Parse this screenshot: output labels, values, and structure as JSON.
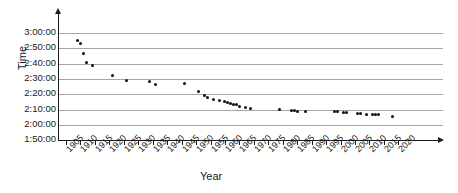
{
  "chart_data": {
    "type": "scatter",
    "title": "",
    "xlabel": "Year",
    "ylabel": "Time",
    "xlim": [
      1903,
      2023
    ],
    "ylim": [
      "1:50:00",
      "3:05:00"
    ],
    "grid": true,
    "legend": "none",
    "xtick_labels": [
      "1905",
      "1910",
      "1915",
      "1920",
      "1925",
      "1930",
      "1935",
      "1940",
      "1945",
      "1950",
      "1955",
      "1960",
      "1965",
      "1970",
      "1975",
      "1980",
      "1985",
      "1990",
      "1995",
      "2000",
      "2005",
      "2010",
      "2015",
      "2020"
    ],
    "ytick_labels": [
      "3:00:00",
      "2:50:00",
      "2:40:00",
      "2:30:00",
      "2:20:00",
      "2:10:00",
      "2:00:00",
      "1:50:00"
    ],
    "ytick_minutes": [
      180,
      170,
      160,
      150,
      140,
      130,
      120,
      110
    ],
    "series": [
      {
        "name": "Winning time",
        "marker": "circle",
        "color": "#0d0d0d",
        "points": [
          {
            "x": 1909,
            "y": 175.0
          },
          {
            "x": 1910,
            "y": 173.0
          },
          {
            "x": 1911,
            "y": 166.5
          },
          {
            "x": 1912,
            "y": 160.5
          },
          {
            "x": 1914,
            "y": 158.5
          },
          {
            "x": 1921,
            "y": 152.5
          },
          {
            "x": 1926,
            "y": 149.0
          },
          {
            "x": 1934,
            "y": 148.0
          },
          {
            "x": 1936,
            "y": 146.5
          },
          {
            "x": 1946,
            "y": 147.0
          },
          {
            "x": 1951,
            "y": 141.5
          },
          {
            "x": 1953,
            "y": 139.0
          },
          {
            "x": 1954,
            "y": 138.0
          },
          {
            "x": 1956,
            "y": 136.5
          },
          {
            "x": 1958,
            "y": 136.0
          },
          {
            "x": 1960,
            "y": 135.5
          },
          {
            "x": 1961,
            "y": 134.5
          },
          {
            "x": 1962,
            "y": 134.0
          },
          {
            "x": 1963,
            "y": 133.5
          },
          {
            "x": 1964,
            "y": 133.0
          },
          {
            "x": 1965,
            "y": 132.0
          },
          {
            "x": 1967,
            "y": 131.0
          },
          {
            "x": 1969,
            "y": 130.5
          },
          {
            "x": 1979,
            "y": 130.0
          },
          {
            "x": 1983,
            "y": 129.5
          },
          {
            "x": 1984,
            "y": 129.5
          },
          {
            "x": 1985,
            "y": 129.0
          },
          {
            "x": 1988,
            "y": 129.0
          },
          {
            "x": 1998,
            "y": 128.5
          },
          {
            "x": 1999,
            "y": 128.5
          },
          {
            "x": 2001,
            "y": 128.0
          },
          {
            "x": 2002,
            "y": 128.0
          },
          {
            "x": 2006,
            "y": 127.5
          },
          {
            "x": 2007,
            "y": 127.5
          },
          {
            "x": 2009,
            "y": 127.0
          },
          {
            "x": 2011,
            "y": 127.0
          },
          {
            "x": 2012,
            "y": 126.8
          },
          {
            "x": 2013,
            "y": 126.8
          },
          {
            "x": 2018,
            "y": 125.5
          }
        ]
      }
    ]
  }
}
